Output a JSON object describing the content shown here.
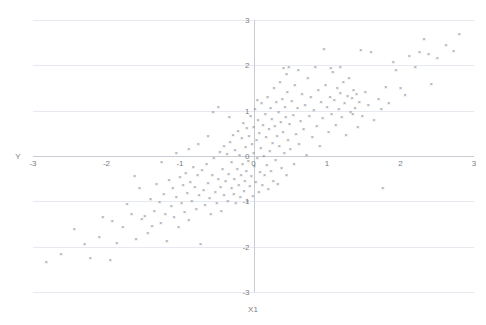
{
  "chart_data": {
    "type": "scatter",
    "title": "",
    "xlabel": "X1",
    "ylabel": "Y",
    "xlim": [
      -3,
      3
    ],
    "ylim": [
      -3,
      3
    ],
    "xticks": [
      -3,
      -2,
      -1,
      0,
      1,
      2,
      3
    ],
    "yticks": [
      -3,
      -2,
      -1,
      0,
      1,
      2,
      3
    ],
    "xtick_labels": [
      "-3",
      "-2",
      "-1",
      "0",
      "1",
      "2",
      "3"
    ],
    "ytick_labels": [
      "-3",
      "-2",
      "-1",
      "0",
      "1",
      "2",
      "3"
    ],
    "grid": "horizontal",
    "legend": "none",
    "marker": "x",
    "marker_color": "#8c8f94",
    "gridline_color": "#e6e9ef",
    "axis_color": "#c9ccd2",
    "n_points": 232,
    "series": [
      {
        "name": "Y vs X1",
        "points": [
          [
            -2.82,
            -2.34
          ],
          [
            -2.62,
            -2.18
          ],
          [
            -2.44,
            -1.62
          ],
          [
            -2.3,
            -1.95
          ],
          [
            -2.22,
            -2.25
          ],
          [
            -2.1,
            -1.79
          ],
          [
            -1.95,
            -2.3
          ],
          [
            -1.92,
            -1.44
          ],
          [
            -1.86,
            -1.93
          ],
          [
            -1.78,
            -1.58
          ],
          [
            -1.72,
            -1.08
          ],
          [
            -1.66,
            -1.28
          ],
          [
            -1.6,
            -1.85
          ],
          [
            -1.55,
            -0.72
          ],
          [
            -1.52,
            -1.4
          ],
          [
            -1.48,
            -1.33
          ],
          [
            -1.44,
            -1.72
          ],
          [
            -1.4,
            -0.96
          ],
          [
            -1.38,
            -1.55
          ],
          [
            -1.35,
            -1.22
          ],
          [
            -1.32,
            -0.62
          ],
          [
            -1.28,
            -1.02
          ],
          [
            -1.26,
            -1.48
          ],
          [
            -1.22,
            -0.84
          ],
          [
            -1.2,
            -1.3
          ],
          [
            -1.18,
            -1.88
          ],
          [
            -1.15,
            -0.55
          ],
          [
            -1.12,
            -1.12
          ],
          [
            -1.1,
            -0.72
          ],
          [
            -1.08,
            -1.36
          ],
          [
            -1.05,
            -0.92
          ],
          [
            -1.02,
            -1.58
          ],
          [
            -1.0,
            -0.48
          ],
          [
            -0.98,
            -1.04
          ],
          [
            -0.96,
            -0.66
          ],
          [
            -0.94,
            -1.24
          ],
          [
            -0.92,
            -0.38
          ],
          [
            -0.9,
            -0.82
          ],
          [
            -0.88,
            -1.42
          ],
          [
            -0.86,
            -0.58
          ],
          [
            -0.84,
            -1.0
          ],
          [
            -0.82,
            -0.26
          ],
          [
            -0.8,
            -0.7
          ],
          [
            -0.78,
            -1.18
          ],
          [
            -0.76,
            -0.44
          ],
          [
            -0.74,
            -0.88
          ],
          [
            -0.72,
            -1.95
          ],
          [
            -0.7,
            -0.32
          ],
          [
            -0.68,
            -0.76
          ],
          [
            -0.66,
            -1.1
          ],
          [
            -0.64,
            -0.18
          ],
          [
            -0.62,
            -0.6
          ],
          [
            -0.6,
            -0.94
          ],
          [
            -0.58,
            -1.3
          ],
          [
            -0.56,
            -0.42
          ],
          [
            -0.54,
            -0.06
          ],
          [
            -0.52,
            -0.8
          ],
          [
            -0.5,
            -1.05
          ],
          [
            -0.48,
            -0.52
          ],
          [
            -0.46,
            0.08
          ],
          [
            -0.45,
            -0.7
          ],
          [
            -0.44,
            -1.22
          ],
          [
            -0.42,
            -0.3
          ],
          [
            -0.4,
            0.22
          ],
          [
            -0.4,
            -0.88
          ],
          [
            -0.38,
            -0.56
          ],
          [
            -0.36,
            0.04
          ],
          [
            -0.35,
            -1.0
          ],
          [
            -0.34,
            -0.4
          ],
          [
            -0.32,
            0.3
          ],
          [
            -0.3,
            -0.72
          ],
          [
            -0.3,
            -0.14
          ],
          [
            -0.28,
            0.45
          ],
          [
            -0.27,
            -0.86
          ],
          [
            -0.26,
            -0.52
          ],
          [
            -0.25,
            0.12
          ],
          [
            -0.24,
            -1.05
          ],
          [
            -0.22,
            -0.3
          ],
          [
            -0.21,
            0.55
          ],
          [
            -0.2,
            -0.66
          ],
          [
            -0.19,
            0.02
          ],
          [
            -0.18,
            -0.92
          ],
          [
            -0.17,
            -0.44
          ],
          [
            -0.16,
            0.38
          ],
          [
            -0.15,
            -0.18
          ],
          [
            -0.14,
            0.72
          ],
          [
            -0.13,
            -0.78
          ],
          [
            -0.12,
            -0.56
          ],
          [
            -0.11,
            0.18
          ],
          [
            -0.1,
            -0.34
          ],
          [
            -0.09,
            0.6
          ],
          [
            -0.08,
            -1.0
          ],
          [
            -0.07,
            -0.12
          ],
          [
            -0.06,
            0.44
          ],
          [
            -0.05,
            -0.68
          ],
          [
            -0.04,
            0.88
          ],
          [
            -0.03,
            -0.46
          ],
          [
            -0.02,
            0.26
          ],
          [
            -0.01,
            -0.9
          ],
          [
            0.0,
            0.06
          ],
          [
            0.0,
            0.62
          ],
          [
            0.01,
            -0.24
          ],
          [
            0.02,
            1.02
          ],
          [
            0.03,
            -0.58
          ],
          [
            0.04,
            0.34
          ],
          [
            0.05,
            -0.05
          ],
          [
            0.06,
            0.78
          ],
          [
            0.07,
            -0.8
          ],
          [
            0.08,
            0.5
          ],
          [
            0.09,
            -0.36
          ],
          [
            0.1,
            0.16
          ],
          [
            0.11,
            1.15
          ],
          [
            0.12,
            -0.64
          ],
          [
            0.13,
            0.68
          ],
          [
            0.14,
            0.0
          ],
          [
            0.15,
            -0.44
          ],
          [
            0.16,
            0.92
          ],
          [
            0.17,
            0.4
          ],
          [
            0.18,
            -0.22
          ],
          [
            0.19,
            1.3
          ],
          [
            0.2,
            -0.74
          ],
          [
            0.21,
            0.58
          ],
          [
            0.22,
            0.1
          ],
          [
            0.23,
            1.05
          ],
          [
            0.24,
            -0.34
          ],
          [
            0.25,
            0.8
          ],
          [
            0.26,
            0.28
          ],
          [
            0.27,
            -0.56
          ],
          [
            0.28,
            1.48
          ],
          [
            0.29,
            0.66
          ],
          [
            0.3,
            -0.1
          ],
          [
            0.31,
            1.18
          ],
          [
            0.32,
            0.44
          ],
          [
            0.33,
            -0.62
          ],
          [
            0.34,
            0.96
          ],
          [
            0.35,
            0.22
          ],
          [
            0.36,
            1.62
          ],
          [
            0.37,
            0.74
          ],
          [
            0.38,
            -0.28
          ],
          [
            0.39,
            1.25
          ],
          [
            0.4,
            0.52
          ],
          [
            0.41,
            1.92
          ],
          [
            0.42,
            0.06
          ],
          [
            0.43,
            1.08
          ],
          [
            0.44,
            0.84
          ],
          [
            0.45,
            -0.44
          ],
          [
            0.46,
            1.4
          ],
          [
            0.47,
            0.34
          ],
          [
            0.48,
            1.95
          ],
          [
            0.49,
            0.7
          ],
          [
            0.5,
            0.14
          ],
          [
            0.52,
            1.2
          ],
          [
            0.54,
            0.9
          ],
          [
            0.55,
            -0.18
          ],
          [
            0.56,
            1.55
          ],
          [
            0.58,
            0.48
          ],
          [
            0.6,
            1.05
          ],
          [
            0.61,
            1.88
          ],
          [
            0.62,
            0.26
          ],
          [
            0.64,
            0.76
          ],
          [
            0.66,
            1.35
          ],
          [
            0.68,
            0.58
          ],
          [
            0.7,
            1.12
          ],
          [
            0.72,
            0.02
          ],
          [
            0.74,
            1.7
          ],
          [
            0.76,
            0.88
          ],
          [
            0.78,
            1.28
          ],
          [
            0.8,
            0.4
          ],
          [
            0.82,
            1.0
          ],
          [
            0.84,
            1.95
          ],
          [
            0.86,
            0.64
          ],
          [
            0.88,
            1.44
          ],
          [
            0.9,
            0.2
          ],
          [
            0.92,
            1.18
          ],
          [
            0.94,
            0.82
          ],
          [
            0.96,
            2.35
          ],
          [
            0.98,
            1.56
          ],
          [
            1.0,
            1.08
          ],
          [
            1.02,
            0.52
          ],
          [
            1.04,
            1.3
          ],
          [
            1.06,
            0.92
          ],
          [
            1.08,
            1.85
          ],
          [
            1.1,
            1.22
          ],
          [
            1.12,
            0.68
          ],
          [
            1.14,
            1.48
          ],
          [
            1.16,
            1.02
          ],
          [
            1.18,
            1.38
          ],
          [
            1.2,
            0.84
          ],
          [
            1.22,
            1.62
          ],
          [
            1.24,
            1.15
          ],
          [
            1.26,
            0.46
          ],
          [
            1.28,
            1.32
          ],
          [
            1.3,
            1.72
          ],
          [
            1.32,
            0.95
          ],
          [
            1.34,
            1.26
          ],
          [
            1.36,
            1.44
          ],
          [
            1.38,
            1.05
          ],
          [
            1.4,
            1.36
          ],
          [
            1.42,
            0.62
          ],
          [
            1.44,
            1.18
          ],
          [
            1.46,
            2.32
          ],
          [
            1.48,
            0.88
          ],
          [
            1.52,
            1.4
          ],
          [
            1.56,
            1.12
          ],
          [
            1.6,
            2.28
          ],
          [
            1.64,
            0.78
          ],
          [
            1.7,
            1.24
          ],
          [
            1.74,
            1.02
          ],
          [
            1.76,
            -0.72
          ],
          [
            1.8,
            1.52
          ],
          [
            1.84,
            1.16
          ],
          [
            1.9,
            2.06
          ],
          [
            1.94,
            1.88
          ],
          [
            2.0,
            1.48
          ],
          [
            2.06,
            1.34
          ],
          [
            2.12,
            2.2
          ],
          [
            2.2,
            1.95
          ],
          [
            2.26,
            2.28
          ],
          [
            2.32,
            2.56
          ],
          [
            2.38,
            2.24
          ],
          [
            2.42,
            1.58
          ],
          [
            2.5,
            2.16
          ],
          [
            2.62,
            2.44
          ],
          [
            2.72,
            2.3
          ],
          [
            2.8,
            2.68
          ],
          [
            -2.05,
            -1.35
          ],
          [
            -1.62,
            -0.45
          ],
          [
            -0.55,
            0.95
          ],
          [
            -0.48,
            1.08
          ],
          [
            -0.33,
            0.85
          ],
          [
            0.05,
            1.22
          ],
          [
            0.45,
            1.8
          ],
          [
            1.05,
            1.92
          ],
          [
            1.18,
            1.95
          ],
          [
            1.35,
            0.92
          ],
          [
            -0.62,
            0.42
          ],
          [
            -0.75,
            0.25
          ],
          [
            -0.88,
            0.15
          ],
          [
            -1.05,
            0.05
          ],
          [
            -1.25,
            -0.15
          ]
        ]
      }
    ]
  }
}
